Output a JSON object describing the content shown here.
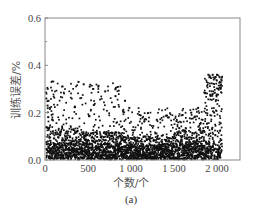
{
  "chart_data": {
    "type": "scatter",
    "title": "",
    "caption": "(a)",
    "xlabel": "个数/个",
    "ylabel": "训练误差/%",
    "xlim": [
      0,
      2270
    ],
    "ylim": [
      0,
      0.6
    ],
    "xticks": [
      0,
      500,
      1000,
      1500,
      2000
    ],
    "xtick_labels": [
      "0",
      "500",
      "1 000",
      "1 500",
      "2 000"
    ],
    "yticks": [
      0.0,
      0.2,
      0.4,
      0.6
    ],
    "ytick_labels": [
      "0.0",
      "0.2",
      "0.4",
      "0.6"
    ],
    "y_minor_ticks": [
      0.1,
      0.3,
      0.5
    ],
    "grid": false,
    "legend": null,
    "marker_color": "#111111",
    "n_points_approx": 2050,
    "highlight_points": [
      {
        "x": 2,
        "y": 0.36
      },
      {
        "x": 5,
        "y": 0.31
      },
      {
        "x": 8,
        "y": 0.28
      },
      {
        "x": 15,
        "y": 0.26
      },
      {
        "x": 30,
        "y": 0.23
      },
      {
        "x": 40,
        "y": 0.25
      },
      {
        "x": 55,
        "y": 0.22
      },
      {
        "x": 390,
        "y": 0.33
      },
      {
        "x": 450,
        "y": 0.32
      },
      {
        "x": 520,
        "y": 0.31
      },
      {
        "x": 560,
        "y": 0.3
      },
      {
        "x": 620,
        "y": 0.31
      },
      {
        "x": 700,
        "y": 0.29
      },
      {
        "x": 820,
        "y": 0.27
      },
      {
        "x": 930,
        "y": 0.25
      },
      {
        "x": 980,
        "y": 0.22
      },
      {
        "x": 1100,
        "y": 0.19
      },
      {
        "x": 1300,
        "y": 0.17
      },
      {
        "x": 1440,
        "y": 0.18
      },
      {
        "x": 1600,
        "y": 0.19
      },
      {
        "x": 1700,
        "y": 0.2
      },
      {
        "x": 1780,
        "y": 0.22
      },
      {
        "x": 1900,
        "y": 0.36
      },
      {
        "x": 1920,
        "y": 0.35
      },
      {
        "x": 1950,
        "y": 0.36
      },
      {
        "x": 1980,
        "y": 0.35
      },
      {
        "x": 2000,
        "y": 0.36
      },
      {
        "x": 2030,
        "y": 0.35
      },
      {
        "x": 2050,
        "y": 0.34
      }
    ],
    "density_profile": [
      {
        "x_range": [
          0,
          100
        ],
        "y_max": 0.36,
        "y_dense_max": 0.22
      },
      {
        "x_range": [
          100,
          400
        ],
        "y_max": 0.33,
        "y_dense_max": 0.14
      },
      {
        "x_range": [
          400,
          900
        ],
        "y_max": 0.33,
        "y_dense_max": 0.12
      },
      {
        "x_range": [
          900,
          1500
        ],
        "y_max": 0.22,
        "y_dense_max": 0.1
      },
      {
        "x_range": [
          1500,
          1850
        ],
        "y_max": 0.22,
        "y_dense_max": 0.13
      },
      {
        "x_range": [
          1850,
          2060
        ],
        "y_max": 0.36,
        "y_dense_max": 0.3
      }
    ]
  }
}
